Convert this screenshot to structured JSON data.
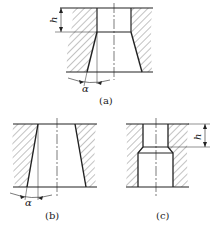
{
  "figures": [
    {
      "id": "a",
      "caption": "(a)",
      "description": "Counterbore with cylindrical land of height h above a tapered (flared) hole of taper angle alpha",
      "dimension_labels": [
        "h",
        "α"
      ]
    },
    {
      "id": "b",
      "caption": "(b)",
      "description": "Fully tapered hole with taper angle alpha",
      "dimension_labels": [
        "α"
      ]
    },
    {
      "id": "c",
      "caption": "(c)",
      "description": "Stepped hole: narrow cylindrical land of height h above a wider cylindrical bore with chamfered transition",
      "dimension_labels": [
        "h"
      ]
    }
  ],
  "labels": {
    "a_caption": "(a)",
    "b_caption": "(b)",
    "c_caption": "(c)",
    "a_h": "h",
    "a_alpha": "α",
    "b_alpha": "α",
    "c_h": "h"
  },
  "colors": {
    "line": "#222222",
    "hatch": "#555555",
    "background": "#ffffff"
  }
}
